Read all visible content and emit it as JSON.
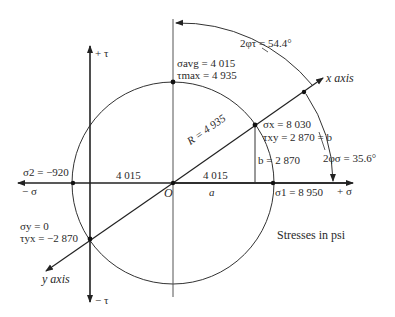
{
  "diagram": {
    "type": "Mohr's circle",
    "units_note": "Stresses in psi",
    "axes": {
      "tau_pos": "+ τ",
      "tau_neg": "− τ",
      "sigma_pos": "+ σ",
      "sigma_neg": "− σ",
      "x_axis": "x axis",
      "y_axis": "y axis"
    },
    "center": {
      "label": "O"
    },
    "avg": {
      "sigma_label": "σavg = 4 015",
      "tau_label": "τmax = 4 935"
    },
    "radius_label": "R = 4 935",
    "left_segment": "4 015",
    "right_segment": "4 015",
    "a_label": "a",
    "b_label": "b = 2 870",
    "point_x": {
      "sigma": "σx = 8 030",
      "tau": "τxy = 2 870 = b"
    },
    "point_y": {
      "sigma": "σy = 0",
      "tau": "τyx = −2 870"
    },
    "sigma1": "σ1 = 8 950",
    "sigma2": "σ2 = −920",
    "angle_tau": "2φτ = 54.4°",
    "angle_sigma": "2φσ = 35.6°",
    "values": {
      "sigma_x": 8030,
      "sigma_y": 0,
      "tau_xy": 2870,
      "tau_yx": -2870,
      "sigma_avg": 4015,
      "tau_max": 4935,
      "R": 4935,
      "sigma_1": 8950,
      "sigma_2": -920,
      "two_phi_tau_deg": 54.4,
      "two_phi_sigma_deg": 35.6
    }
  }
}
